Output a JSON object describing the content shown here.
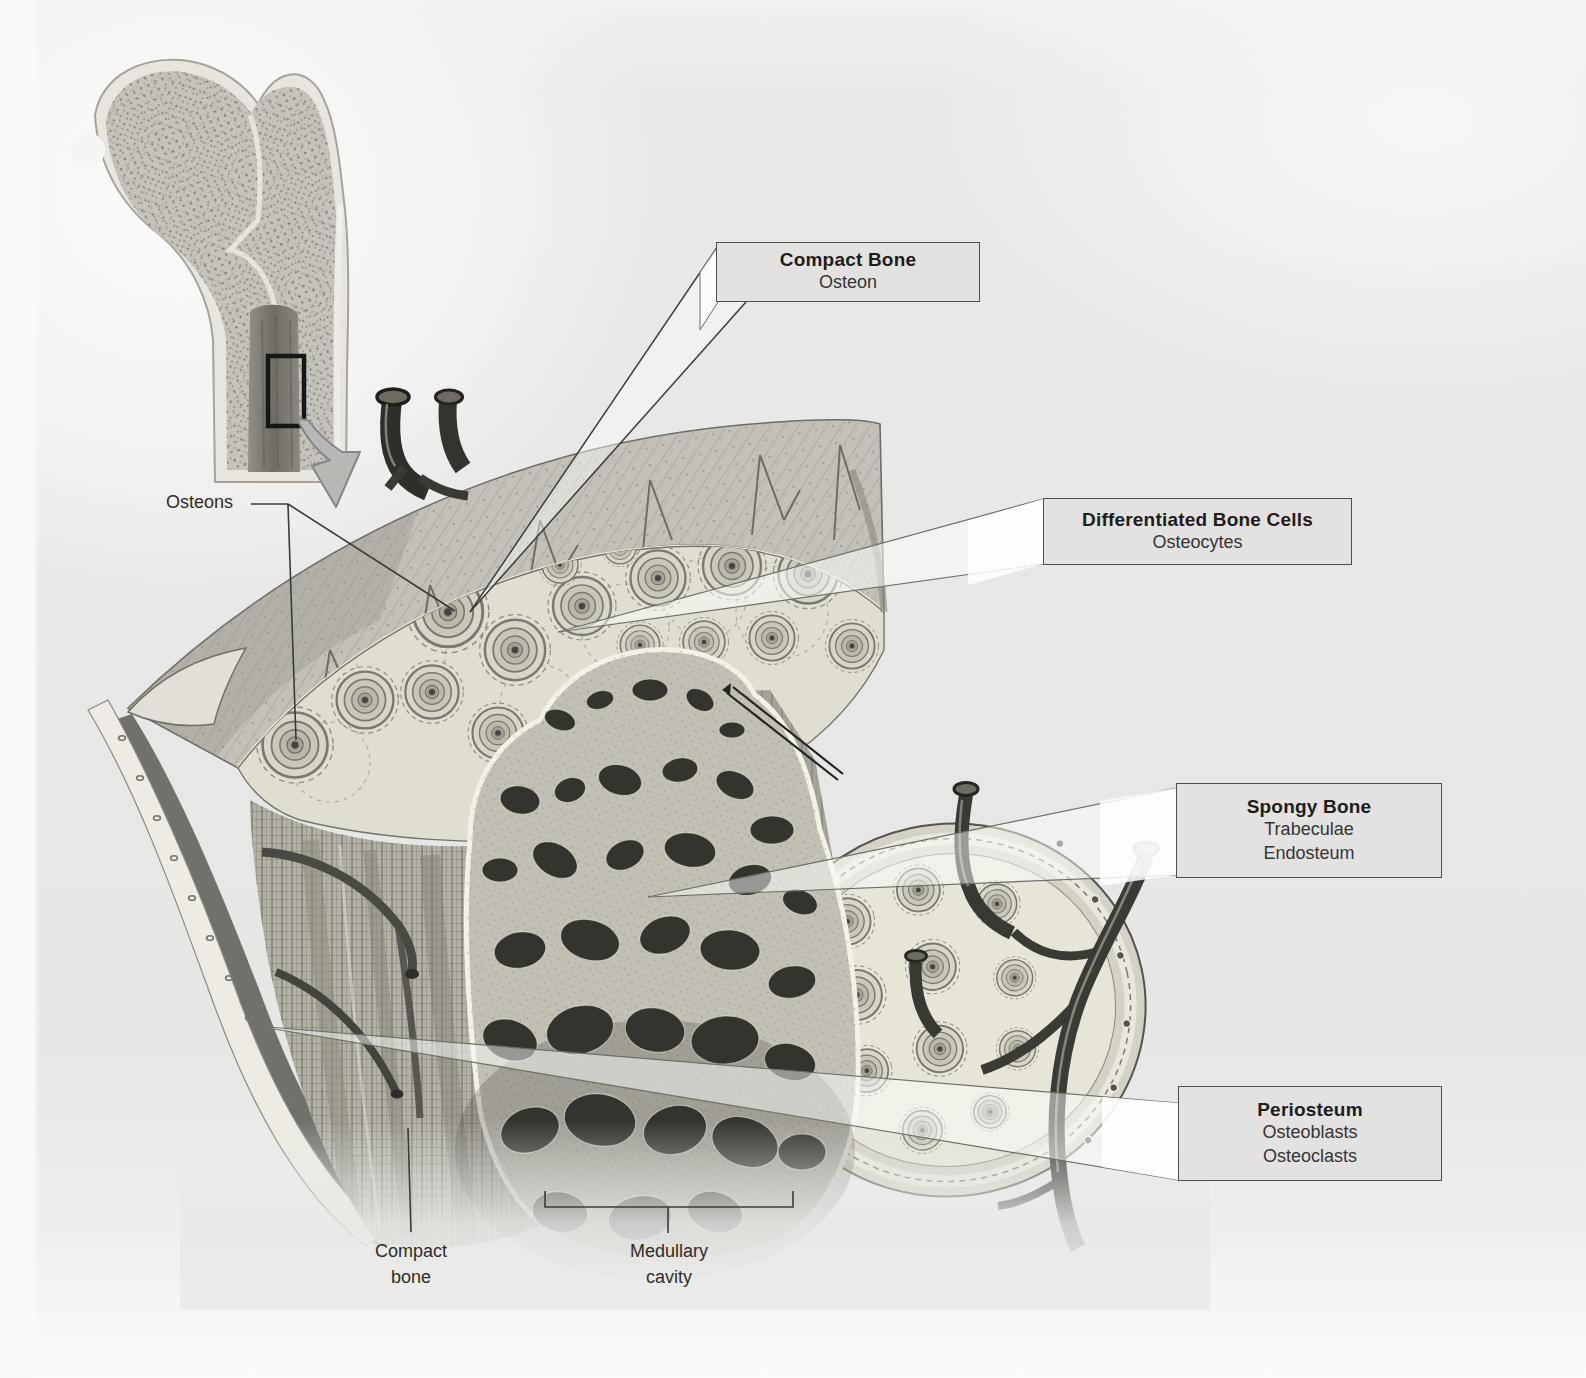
{
  "figure": {
    "type": "anatomical-diagram"
  },
  "callouts": [
    {
      "id": "compact-bone",
      "title": "Compact Bone",
      "lines": [
        "Osteon"
      ]
    },
    {
      "id": "differentiated-bone-cells",
      "title": "Differentiated Bone Cells",
      "lines": [
        "Osteocytes"
      ]
    },
    {
      "id": "spongy-bone",
      "title": "Spongy Bone",
      "lines": [
        "Trabeculae",
        "Endosteum"
      ]
    },
    {
      "id": "periosteum",
      "title": "Periosteum",
      "lines": [
        "Osteoblasts",
        "Osteoclasts"
      ]
    }
  ],
  "labels": {
    "osteons": "Osteons",
    "compact_bone": "Compact\nbone",
    "medullary_cavity": "Medullary\ncavity"
  },
  "colors": {
    "page_bg": "#e8e8e6",
    "box_bg": "#e3e2e0",
    "box_border": "#4f4e4a",
    "leader_line": "#3c3b38",
    "bone_surface": "#e0ded1",
    "bone_mid": "#b5b3a8",
    "periosteum_band": "#c2c0b6",
    "trabecula_hole": "#35332d",
    "vessel_dark": "#3a3833",
    "callout_wedge": "rgba(252,252,250,0.55)"
  }
}
